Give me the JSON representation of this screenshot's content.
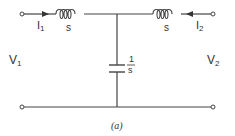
{
  "diagram": {
    "type": "two-port T-network circuit",
    "caption": "(a)",
    "colors": {
      "wire": "#444444",
      "text": "#333333",
      "background": "#ffffff"
    },
    "ports": {
      "left": {
        "voltage_label": "V",
        "voltage_sub": "1",
        "current_label": "I",
        "current_sub": "1",
        "current_direction": "right"
      },
      "right": {
        "voltage_label": "V",
        "voltage_sub": "2",
        "current_label": "I",
        "current_sub": "2",
        "current_direction": "left"
      }
    },
    "components": [
      {
        "id": "L1",
        "kind": "inductor",
        "impedance": "s",
        "position": "top-left series"
      },
      {
        "id": "L2",
        "kind": "inductor",
        "impedance": "s",
        "position": "top-right series"
      },
      {
        "id": "C1",
        "kind": "capacitor",
        "impedance_num": "1",
        "impedance_den": "s",
        "position": "shunt center"
      }
    ]
  }
}
